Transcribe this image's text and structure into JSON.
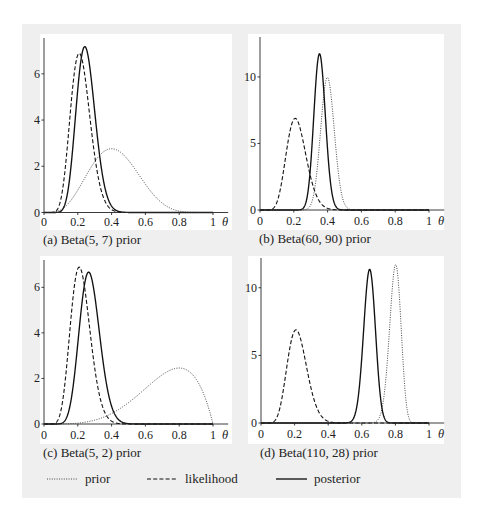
{
  "legend": {
    "items": [
      {
        "label": "prior",
        "style": "dotted"
      },
      {
        "label": "likelihood",
        "style": "dashed"
      },
      {
        "label": "posterior",
        "style": "solid"
      }
    ]
  },
  "colors": {
    "panel_background": "#efefef",
    "plot_background": "#ffffff",
    "ink": "#222222"
  },
  "chart_data": [
    {
      "panel": "a",
      "type": "line",
      "caption": "(a) Beta(5, 7) prior",
      "title": "",
      "xlabel": "θ",
      "ylabel": "",
      "xlim": [
        0,
        1
      ],
      "ylim": [
        0,
        7.55
      ],
      "grid": false,
      "xticks": [
        0,
        0.2,
        0.4,
        0.6,
        0.8,
        1
      ],
      "xtick_labels": [
        "0",
        "0.2",
        "0.4",
        "0.6",
        "0.8",
        "1"
      ],
      "yticks": [
        0,
        2,
        4,
        6
      ],
      "ytick_labels": [
        "0",
        "2",
        "4",
        "6"
      ],
      "series": [
        {
          "name": "prior",
          "style": "dotted",
          "distribution": "Beta",
          "alpha": 5,
          "beta": 7,
          "mode": 0.4,
          "peak_density": 2.76
        },
        {
          "name": "likelihood",
          "style": "dashed",
          "distribution": "Beta",
          "alpha": 11,
          "beta": 39,
          "mode": 0.21,
          "peak_density": 6.9
        },
        {
          "name": "posterior",
          "style": "solid",
          "distribution": "Beta",
          "alpha": 15,
          "beta": 45,
          "mode": 0.24,
          "peak_density": 7.2
        }
      ]
    },
    {
      "panel": "b",
      "type": "line",
      "caption": "(b) Beta(60, 90) prior",
      "title": "",
      "xlabel": "θ",
      "ylabel": "",
      "xlim": [
        0,
        1
      ],
      "ylim": [
        0,
        13
      ],
      "grid": false,
      "xticks": [
        0,
        0.2,
        0.4,
        0.6,
        0.8,
        1
      ],
      "xtick_labels": [
        "0",
        "0.2",
        "0.4",
        "0.6",
        "0.8",
        "1"
      ],
      "yticks": [
        0,
        5,
        10
      ],
      "ytick_labels": [
        "0",
        "5",
        "10"
      ],
      "series": [
        {
          "name": "prior",
          "style": "dotted",
          "distribution": "Beta",
          "alpha": 60,
          "beta": 90,
          "mode": 0.4,
          "peak_density": 10.0
        },
        {
          "name": "likelihood",
          "style": "dashed",
          "distribution": "Beta",
          "alpha": 11,
          "beta": 39,
          "mode": 0.21,
          "peak_density": 6.9
        },
        {
          "name": "posterior",
          "style": "solid",
          "distribution": "Beta",
          "alpha": 70,
          "beta": 128,
          "mode": 0.35,
          "peak_density": 11.8
        }
      ]
    },
    {
      "panel": "c",
      "type": "line",
      "caption": "(c) Beta(5, 2) prior",
      "title": "",
      "xlabel": "θ",
      "ylabel": "",
      "xlim": [
        0,
        1
      ],
      "ylim": [
        0,
        7.2
      ],
      "grid": false,
      "xticks": [
        0,
        0.2,
        0.4,
        0.6,
        0.8,
        1
      ],
      "xtick_labels": [
        "0",
        "0.2",
        "0.4",
        "0.6",
        "0.8",
        "1"
      ],
      "yticks": [
        0,
        2,
        4,
        6
      ],
      "ytick_labels": [
        "0",
        "2",
        "4",
        "6"
      ],
      "series": [
        {
          "name": "prior",
          "style": "dotted",
          "distribution": "Beta",
          "alpha": 5,
          "beta": 2,
          "mode": 0.8,
          "peak_density": 2.46
        },
        {
          "name": "likelihood",
          "style": "dashed",
          "distribution": "Beta",
          "alpha": 11,
          "beta": 39,
          "mode": 0.21,
          "peak_density": 6.9
        },
        {
          "name": "posterior",
          "style": "solid",
          "distribution": "Beta",
          "alpha": 15,
          "beta": 40,
          "mode": 0.26,
          "peak_density": 6.7
        }
      ]
    },
    {
      "panel": "d",
      "type": "line",
      "caption": "(d) Beta(110, 28) prior",
      "title": "",
      "xlabel": "θ",
      "ylabel": "",
      "xlim": [
        0,
        1
      ],
      "ylim": [
        0,
        12.2
      ],
      "grid": false,
      "xticks": [
        0,
        0.2,
        0.4,
        0.6,
        0.8,
        1
      ],
      "xtick_labels": [
        "0",
        "0.2",
        "0.4",
        "0.6",
        "0.8",
        "1"
      ],
      "yticks": [
        0,
        5,
        10
      ],
      "ytick_labels": [
        "0",
        "5",
        "10"
      ],
      "series": [
        {
          "name": "prior",
          "style": "dotted",
          "distribution": "Beta",
          "alpha": 110,
          "beta": 28,
          "mode": 0.8,
          "peak_density": 11.7
        },
        {
          "name": "likelihood",
          "style": "dashed",
          "distribution": "Beta",
          "alpha": 11,
          "beta": 39,
          "mode": 0.21,
          "peak_density": 6.9
        },
        {
          "name": "posterior",
          "style": "solid",
          "distribution": "Beta",
          "alpha": 120,
          "beta": 66,
          "mode": 0.65,
          "peak_density": 11.4
        }
      ]
    }
  ]
}
